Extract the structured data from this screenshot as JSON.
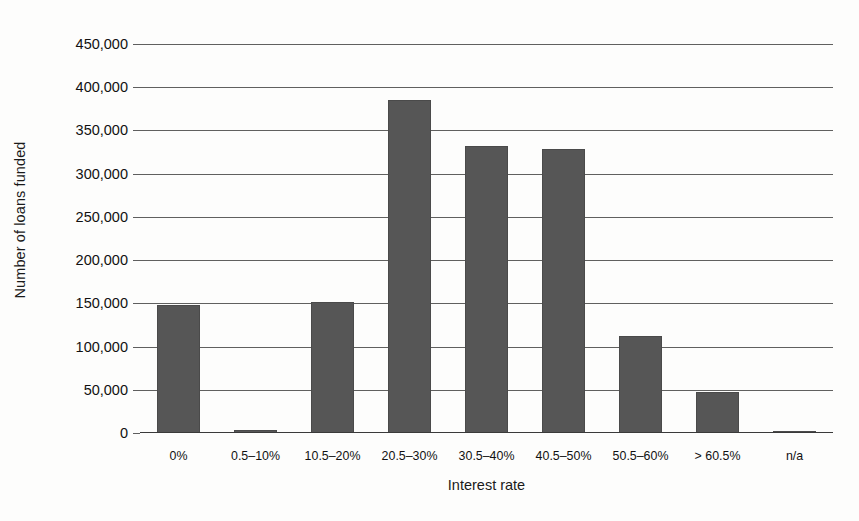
{
  "chart_data": {
    "type": "bar",
    "title": "",
    "subtitle": "",
    "xlabel": "Interest rate",
    "ylabel": "Number of loans funded",
    "categories": [
      "0%",
      "0.5–10%",
      "10.5–20%",
      "20.5–30%",
      "30.5–40%",
      "40.5–50%",
      "50.5–60%",
      "> 60.5%",
      "n/a"
    ],
    "values": [
      148000,
      4000,
      152000,
      385000,
      332000,
      328000,
      112000,
      47000,
      2000
    ],
    "ylim": [
      0,
      450000
    ],
    "ytick_values": [
      0,
      50000,
      100000,
      150000,
      200000,
      250000,
      300000,
      350000,
      400000,
      450000
    ],
    "ytick_labels": [
      "0",
      "50,000",
      "100,000",
      "150,000",
      "200,000",
      "250,000",
      "300,000",
      "350,000",
      "400,000",
      "450,000"
    ],
    "grid": true,
    "grid_axis": "y",
    "legend": false,
    "legend_position": "none",
    "series_name": "Number of loans funded",
    "bar_color": "#565656",
    "gridline_color": "#60605f",
    "axis_color": "#3a3a3a",
    "background_color": "#fdfdfc",
    "text_color": "#1a1a1a",
    "annotations": []
  }
}
